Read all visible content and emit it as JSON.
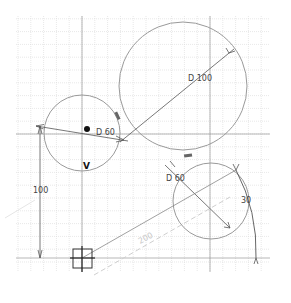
{
  "canvas": {
    "width": 291,
    "height": 303,
    "background": "#ffffff"
  },
  "grid": {
    "x0": 16,
    "y0": 16,
    "x1": 270,
    "y1": 272,
    "minor_spacing": 12.8,
    "minor_color": "#d9d9d9",
    "major_color": "#9a9a9a",
    "major_x": [
      82,
      210
    ],
    "major_y": [
      134,
      258
    ]
  },
  "colors": {
    "geometry": "#9a9a9a",
    "dimension": "#555555",
    "construction": "#cfcfcf",
    "marker": "#222222"
  },
  "circles": [
    {
      "id": "circle-small-left",
      "cx": 82,
      "cy": 133,
      "r": 38,
      "label": "D 60"
    },
    {
      "id": "circle-large",
      "cx": 183,
      "cy": 86,
      "r": 64,
      "label": "D 100"
    },
    {
      "id": "circle-small-lower",
      "cx": 211,
      "cy": 201,
      "r": 38,
      "label": "D 60"
    }
  ],
  "labels": {
    "dim_small_left": "D 60",
    "dim_large": "D 100",
    "dim_small_lower": "D 60",
    "dim_vertical": "100",
    "dim_arc": "30",
    "dim_construction": "200",
    "vertex_marker": "V"
  },
  "points": {
    "origin": {
      "x": 82,
      "y": 258
    },
    "dot": {
      "x": 87,
      "y": 129
    }
  }
}
